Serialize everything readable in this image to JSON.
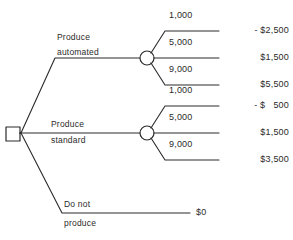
{
  "diagram": {
    "type": "decision-tree",
    "title": "",
    "nodes": {
      "decision_node": {
        "shape": "square",
        "name": "decision-node"
      },
      "chance_node_automated": {
        "shape": "circle",
        "name": "chance-node-automated"
      },
      "chance_node_standard": {
        "shape": "circle",
        "name": "chance-node-standard"
      }
    },
    "decisions": [
      {
        "id": "produce-automated",
        "label_line1": "Produce",
        "label_line2": "automated",
        "outcomes": [
          {
            "quantity": "1,000",
            "payoff": "- $2,500"
          },
          {
            "quantity": "5,000",
            "payoff": "$1,500"
          },
          {
            "quantity": "9,000",
            "payoff": "$5,500"
          }
        ]
      },
      {
        "id": "produce-standard",
        "label_line1": "Produce",
        "label_line2": "standard",
        "outcomes": [
          {
            "quantity": "1,000",
            "payoff": "- $   500"
          },
          {
            "quantity": "5,000",
            "payoff": "$1,500"
          },
          {
            "quantity": "9,000",
            "payoff": "$3,500"
          }
        ]
      },
      {
        "id": "do-not-produce",
        "label_line1": "Do not",
        "label_line2": "produce",
        "outcomes": [
          {
            "quantity": "",
            "payoff": "$0"
          }
        ]
      }
    ],
    "colors": {
      "line": "#2b2b2b",
      "text": "#2b2b2b",
      "background": "#ffffff"
    }
  }
}
